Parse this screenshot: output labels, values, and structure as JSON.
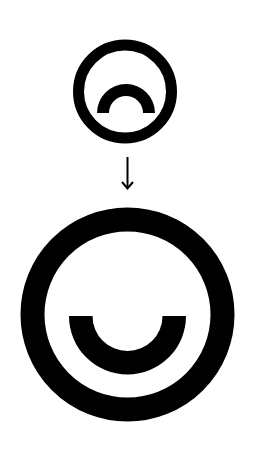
{
  "diagram": {
    "type": "transformation",
    "background_color": "#ffffff",
    "ink_color": "#000000",
    "nodes": [
      {
        "id": "small-face",
        "label": "Small circle with upward arc (frown)",
        "shape": "ring-with-arc",
        "arc_orientation": "up",
        "center": [
          125,
          91.5
        ],
        "outer_radius": 52,
        "stroke_width": 11,
        "arc": {
          "center": [
            126,
            113
          ],
          "outer_radius": 29,
          "inner_radius": 17
        }
      },
      {
        "id": "large-face",
        "label": "Large circle with downward arc (smile)",
        "shape": "ring-with-arc",
        "arc_orientation": "down",
        "center": [
          127.5,
          314.5
        ],
        "outer_radius": 107,
        "stroke_width": 24,
        "arc": {
          "center": [
            127.5,
            316
          ],
          "outer_radius": 58.5,
          "inner_radius": 35
        }
      }
    ],
    "edges": [
      {
        "from": "small-face",
        "to": "large-face",
        "style": "arrow",
        "direction": "down",
        "label": "Downward arrow"
      }
    ]
  }
}
